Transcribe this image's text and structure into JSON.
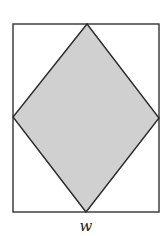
{
  "diagram": {
    "rectangle": {
      "x": 13,
      "y": 24,
      "width": 146,
      "height": 188,
      "stroke": "#333333",
      "fill": "#ffffff"
    },
    "rhombus": {
      "points": "87,24 159,118 86,212 13,117",
      "fill": "#d0d0d0",
      "stroke": "#2a2a2a"
    },
    "labels": {
      "width": "w"
    }
  }
}
